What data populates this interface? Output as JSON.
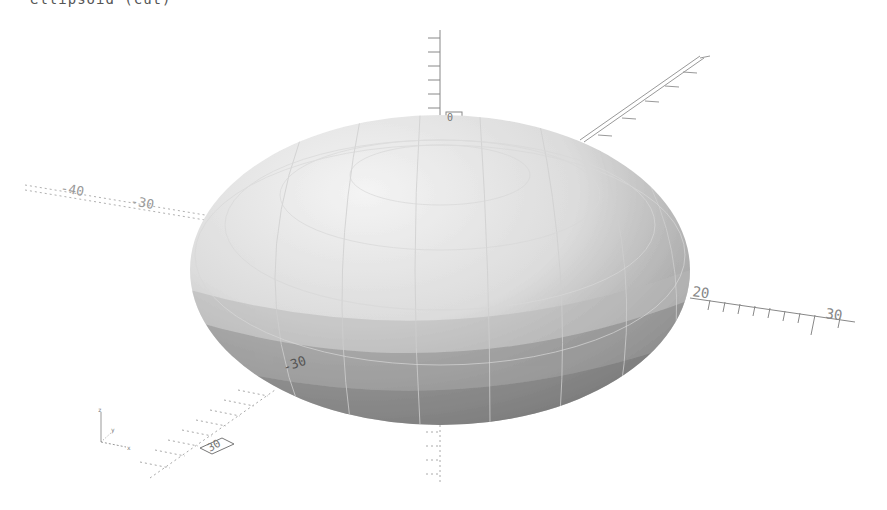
{
  "viewport": {
    "title_partial": "ellipsoid (cut)",
    "background": "#ffffff",
    "object": {
      "shape": "ellipsoid",
      "facet_colors": [
        "#f2f2f2",
        "#e6e6e6",
        "#d6d6d6",
        "#c4c4c4",
        "#a8a8a8",
        "#8a8a8a",
        "#6e6e6e"
      ]
    },
    "axes": {
      "x_negative_labels": [
        "-40",
        "-30"
      ],
      "x_positive_labels": [
        "20",
        "30"
      ],
      "y_negative_labels": [
        "-30"
      ],
      "y_positive_label": "",
      "z_label": "0",
      "front_label": "30"
    },
    "orientation_gizmo": {
      "x": "x",
      "y": "y",
      "z": "z"
    }
  }
}
